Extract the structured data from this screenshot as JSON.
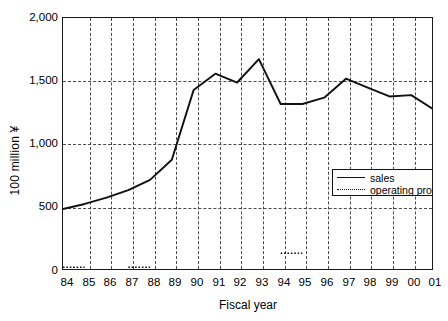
{
  "chart_data": {
    "type": "line",
    "title": "",
    "xlabel": "Fiscal year",
    "ylabel": "100 million ¥",
    "categories": [
      "84",
      "85",
      "86",
      "87",
      "88",
      "89",
      "90",
      "91",
      "92",
      "93",
      "94",
      "95",
      "96",
      "97",
      "98",
      "99",
      "00",
      "01"
    ],
    "ylim": [
      0,
      2000
    ],
    "yticks": [
      "0",
      "500",
      "1,000",
      "1,500",
      "2,000"
    ],
    "ytick_values": [
      0,
      500,
      1000,
      1500,
      2000
    ],
    "grid": "both-dashed",
    "legend_position": "center",
    "series": [
      {
        "name": "sales",
        "style": "solid",
        "values": [
          490,
          530,
          580,
          640,
          720,
          880,
          1430,
          1560,
          1490,
          1675,
          1320,
          1320,
          1370,
          1520,
          1450,
          1380,
          1390,
          1280
        ]
      },
      {
        "name": "operating profit",
        "style": "dotted",
        "values": [
          30,
          30,
          null,
          30,
          30,
          null,
          null,
          null,
          null,
          null,
          140,
          140,
          null,
          null,
          null,
          null,
          null,
          null
        ]
      }
    ]
  },
  "legend": {
    "entries": [
      {
        "label": "sales",
        "key": "solid-line-key"
      },
      {
        "label": "operating profit",
        "key": "dotted-line-key"
      }
    ]
  },
  "axes": {
    "y_title": "100 million ¥",
    "x_title": "Fiscal year",
    "y_labels": [
      "2,000",
      "1,500",
      "1,000",
      "500",
      "0"
    ],
    "x_labels": [
      "84",
      "85",
      "86",
      "87",
      "88",
      "89",
      "90",
      "91",
      "92",
      "93",
      "94",
      "95",
      "96",
      "97",
      "98",
      "99",
      "00",
      "01"
    ]
  }
}
